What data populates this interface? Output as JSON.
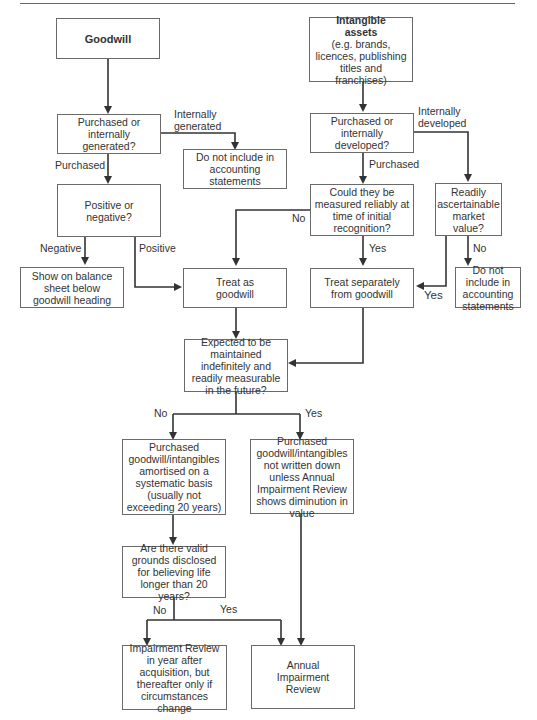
{
  "diagram": {
    "nodes": {
      "goodwill": {
        "label": "Goodwill"
      },
      "intangible_title": {
        "label": "Intangible assets"
      },
      "intangible_sub": {
        "label": "(e.g. brands, licences, publishing titles and franchises)"
      },
      "purchased_or_generated": {
        "label": "Purchased or internally generated?"
      },
      "do_not_include_1": {
        "label": "Do not include in accounting statements"
      },
      "purchased_or_developed": {
        "label": "Purchased or internally developed?"
      },
      "positive_or_negative": {
        "label": "Positive or negative?"
      },
      "measured_reliably": {
        "label": "Could they be measured reliably at time of initial recognition?"
      },
      "readily_ascertainable": {
        "label": "Readily ascertainable market value?"
      },
      "show_on_balance_sheet": {
        "label": "Show on balance sheet below goodwill heading"
      },
      "treat_as_goodwill": {
        "label": "Treat as goodwill"
      },
      "treat_separately": {
        "label": "Treat separately from goodwill"
      },
      "do_not_include_2": {
        "label": "Do not include in accounting statements"
      },
      "expected_maintained": {
        "label": "Expected to be maintained indefinitely and readily measurable in the future?"
      },
      "amortised": {
        "label": "Purchased goodwill/intangibles amortised on a systematic basis (usually not exceeding 20 years)"
      },
      "not_written_down": {
        "label": "Purchased goodwill/intangibles not written down unless Annual Impairment Review shows diminution in value"
      },
      "valid_grounds": {
        "label": "Are there valid grounds disclosed for believing life longer than 20 years?"
      },
      "impairment_review_year_after": {
        "label": "Impairment Review in year after acquisition, but thereafter only if circumstances change"
      },
      "annual_impairment_review": {
        "label": "Annual Impairment Review"
      }
    },
    "edge_labels": {
      "internally_generated": "Internally generated",
      "purchased_1": "Purchased",
      "internally_developed": "Internally developed",
      "purchased_2": "Purchased",
      "negative": "Negative",
      "positive": "Positive",
      "no_measured": "No",
      "yes_measured": "Yes",
      "no_market": "No",
      "yes_market": "Yes",
      "no_expected": "No",
      "yes_expected": "Yes",
      "no_grounds": "No",
      "yes_grounds": "Yes"
    },
    "colors": {
      "line": "#333333",
      "box_border": "#6a6a6a",
      "text": "#333333"
    }
  }
}
